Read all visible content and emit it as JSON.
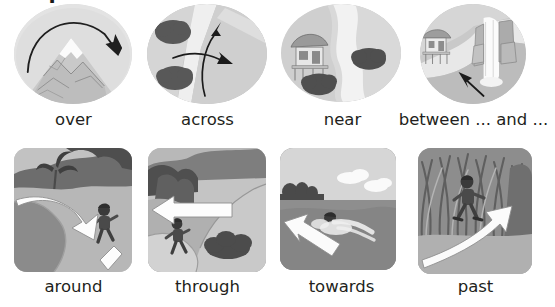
{
  "page": {
    "title": "Prepositions",
    "background": "#ffffff",
    "text_color": "#231f20"
  },
  "rows": [
    {
      "name": "prepositions-row-1",
      "style": "oval",
      "items": [
        {
          "caption": "over",
          "icon": "mountain-over-icon",
          "scene": "arched arrow passing over a snow-capped mountain",
          "arrow": "curved-arc-arrow-right"
        },
        {
          "caption": "across",
          "icon": "river-across-icon",
          "scene": "two arrows crossing a winding river with bushes",
          "arrow": "two-crossing-arrows"
        },
        {
          "caption": "near",
          "icon": "hut-near-river-icon",
          "scene": "stilt hut beside a winding river with two bushes",
          "arrow": "none"
        },
        {
          "caption": "between ... and ...",
          "icon": "hut-waterfall-between-icon",
          "scene": "arrow pointing to the gap between a hut and a waterfall",
          "arrow": "straight-arrow-up-left"
        }
      ]
    },
    {
      "name": "prepositions-row-2",
      "style": "card",
      "items": [
        {
          "caption": "around",
          "icon": "child-around-lake-icon",
          "scene": "child running along a path curving around a lake",
          "arrow": "curved-3d-arrow-down-right"
        },
        {
          "caption": "through",
          "icon": "child-through-path-icon",
          "scene": "child walking on a path through hills",
          "arrow": "straight-3d-arrow-left"
        },
        {
          "caption": "towards",
          "icon": "swimmer-towards-shore-icon",
          "scene": "person swimming in water heading towards the shore",
          "arrow": "straight-3d-arrow-left-down"
        },
        {
          "caption": "past",
          "icon": "child-past-grass-icon",
          "scene": "child walking past tall grass",
          "arrow": "curved-3d-arrow-right"
        }
      ]
    }
  ],
  "colors": {
    "ink": "#231f20",
    "oval_bg": "#dcdcdc",
    "river": "#f0f0f0",
    "bush_dark": "#4a4a4a",
    "arrow_fill": "#ffffff",
    "arrow_stroke": "#2b2b2b",
    "land_mid": "#b0b0b0",
    "land_dark": "#6e6e6e",
    "water": "#8f8f8f",
    "sky": "#d8d8d8"
  }
}
